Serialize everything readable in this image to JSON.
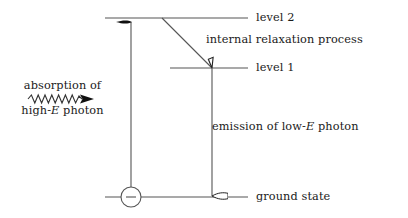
{
  "figure": {
    "type": "energy-level-diagram",
    "title": "",
    "background_color": "#ffffff",
    "line_color": "#555555",
    "text_color": "#1a1a1a"
  },
  "levels": [
    {
      "id": "level-2",
      "label": "level 2",
      "line": {
        "x1": 105,
        "x2": 248,
        "y": 18
      },
      "label_x": 256,
      "label_y": 11
    },
    {
      "id": "level-1",
      "label": "level 1",
      "line": {
        "x1": 170,
        "x2": 248,
        "y": 68
      },
      "label_x": 256,
      "label_y": 61
    },
    {
      "id": "ground-state",
      "label": "ground state",
      "line": {
        "x1": 105,
        "x2": 248,
        "y": 197
      },
      "label_x": 256,
      "label_y": 190
    }
  ],
  "transitions": {
    "absorption": {
      "label_line1": "absorption of",
      "label_line2_prefix": "high-",
      "label_line2_symbol": "E",
      "label_line2_suffix": " photon",
      "arrow": {
        "x": 131,
        "y_from": 188,
        "y_to": 20,
        "head": "solid",
        "direction": "up"
      }
    },
    "relaxation": {
      "label": "internal relaxation process",
      "label_x": 206,
      "label_y": 33,
      "arrow": {
        "x1": 162,
        "y1": 18,
        "x2": 212,
        "y2": 68,
        "head": "hollow",
        "direction": "down-right"
      }
    },
    "emission": {
      "label_prefix": "emission of low-",
      "label_symbol": "E",
      "label_suffix": " photon",
      "label_x": 212,
      "label_y": 120,
      "arrow": {
        "x": 212,
        "y_from": 68,
        "y_to": 197,
        "head": "hollow",
        "direction": "down"
      }
    }
  },
  "photon_wave": {
    "name": "incoming-photon-squiggle",
    "x_start": 28,
    "x_end": 82,
    "y": 99,
    "amplitude": 4,
    "cycles": 8
  },
  "electron": {
    "name": "electron-marker",
    "symbol": "−",
    "cx": 131,
    "cy": 197,
    "r": 10
  }
}
